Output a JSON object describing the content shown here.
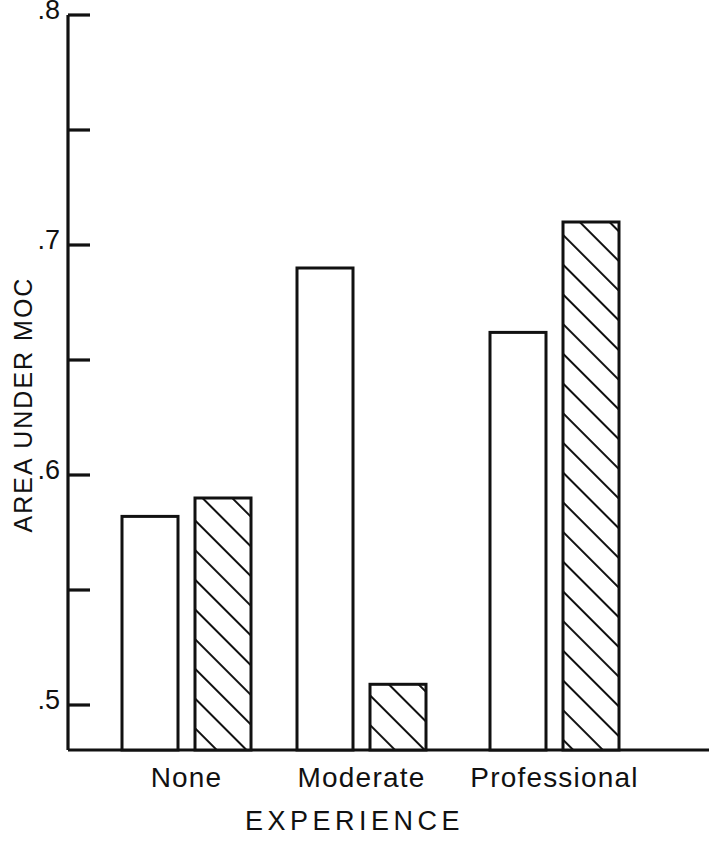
{
  "chart_data": {
    "type": "bar",
    "title": "",
    "subtitle": "",
    "xlabel": "EXPERIENCE",
    "ylabel": "AREA UNDER MOC",
    "categories": [
      "None",
      "Moderate",
      "Professional"
    ],
    "series": [
      {
        "name": "open",
        "fill": "open",
        "values": [
          0.582,
          0.69,
          0.662
        ]
      },
      {
        "name": "hatched",
        "fill": "diagonal-hatch",
        "values": [
          0.59,
          0.509,
          0.71
        ]
      }
    ],
    "ylim": [
      0.48,
      0.8
    ],
    "y_major_ticks": [
      0.5,
      0.6,
      0.7,
      0.8
    ],
    "y_major_tick_labels": [
      ".5",
      ".6",
      ".7",
      ".8"
    ],
    "y_minor_ticks": [
      0.55,
      0.65,
      0.75
    ],
    "grid": false,
    "legend": "none",
    "colors": {
      "ink": "#111111",
      "bar_fill_open": "#ffffff",
      "bar_stroke": "#111111",
      "hatch_stroke": "#111111",
      "background": "#ffffff"
    }
  }
}
